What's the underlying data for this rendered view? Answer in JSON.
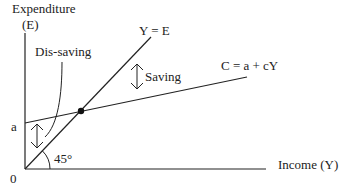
{
  "diagram": {
    "y_axis": {
      "label_line1": "Expenditure",
      "label_line2": "(E)"
    },
    "x_axis": {
      "label": "Income (Y)"
    },
    "origin_label": "0",
    "intercept_label": "a",
    "lines": [
      {
        "name": "45-degree line",
        "label": "Y = E"
      },
      {
        "name": "consumption function",
        "label": "C = a + cY"
      }
    ],
    "annotations": {
      "saving": "Saving",
      "dissaving": "Dis-saving",
      "angle": "45°"
    },
    "colors": {
      "line": "#222222",
      "background": "#ffffff"
    }
  }
}
